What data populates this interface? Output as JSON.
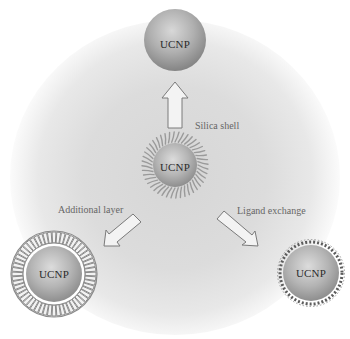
{
  "diagram": {
    "type": "surface-modification-schematic",
    "center_particle": {
      "label": "UCNP",
      "coating": "ligand hairs (original hydrophobic ligands)",
      "x": 175,
      "y": 165,
      "radius": 22
    },
    "products": [
      {
        "id": "silica",
        "label": "UCNP",
        "coating": "silica shell",
        "x": 175,
        "y": 40,
        "radius": 31
      },
      {
        "id": "additional-layer",
        "label": "UCNP",
        "coating": "bilayer / additional layer",
        "x": 54,
        "y": 274,
        "radius": 30
      },
      {
        "id": "ligand-exchange",
        "label": "UCNP",
        "coating": "short exchanged ligands",
        "x": 311,
        "y": 273,
        "radius": 28
      }
    ],
    "arrows": [
      {
        "id": "to-silica",
        "label": "Silica shell"
      },
      {
        "id": "to-additional",
        "label": "Additional layer"
      },
      {
        "id": "to-ligand",
        "label": "Ligand exchange"
      }
    ]
  },
  "colors": {
    "background": "#ffffff",
    "glow": "#d8d8d8",
    "particle_light": "#d4d4d4",
    "particle_dark": "#8a8a8a",
    "arrow_stroke": "#7a7a7a",
    "text": "#2b2b2b",
    "label_text": "#666666"
  }
}
